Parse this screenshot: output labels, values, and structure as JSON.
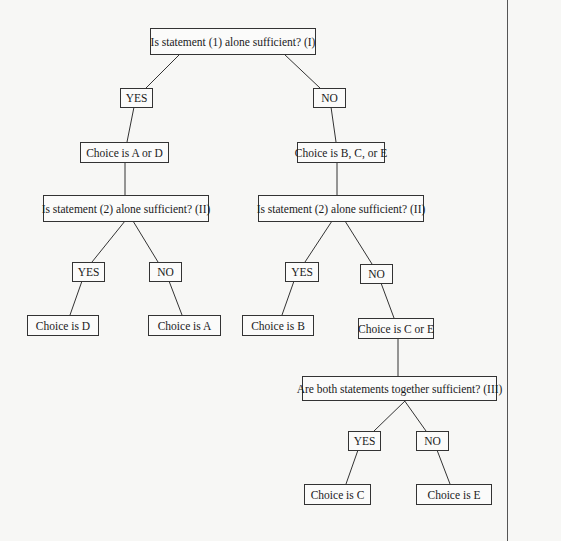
{
  "diagram": {
    "type": "decision-tree",
    "nodes": {
      "q1": "Is statement (1) alone sufficient? (I)",
      "q1_yes": "YES",
      "q1_no": "NO",
      "choice_ad": "Choice is A or D",
      "choice_bce": "Choice is B, C, or E",
      "q2_left": "Is statement (2) alone sufficient? (II)",
      "q2_right": "Is statement (2) alone sufficient? (II)",
      "q2l_yes": "YES",
      "q2l_no": "NO",
      "q2r_yes": "YES",
      "q2r_no": "NO",
      "choice_d": "Choice is D",
      "choice_a": "Choice is A",
      "choice_b": "Choice is B",
      "choice_ce": "Choice is C or E",
      "q3": "Are both statements together sufficient? (III)",
      "q3_yes": "YES",
      "q3_no": "NO",
      "choice_c": "Choice is C",
      "choice_e": "Choice is E"
    },
    "edges": [
      [
        "q1",
        "q1_yes"
      ],
      [
        "q1",
        "q1_no"
      ],
      [
        "q1_yes",
        "choice_ad"
      ],
      [
        "q1_no",
        "choice_bce"
      ],
      [
        "choice_ad",
        "q2_left"
      ],
      [
        "choice_bce",
        "q2_right"
      ],
      [
        "q2_left",
        "q2l_yes"
      ],
      [
        "q2_left",
        "q2l_no"
      ],
      [
        "q2l_yes",
        "choice_d"
      ],
      [
        "q2l_no",
        "choice_a"
      ],
      [
        "q2_right",
        "q2r_yes"
      ],
      [
        "q2_right",
        "q2r_no"
      ],
      [
        "q2r_yes",
        "choice_b"
      ],
      [
        "q2r_no",
        "choice_ce"
      ],
      [
        "choice_ce",
        "q3"
      ],
      [
        "q3",
        "q3_yes"
      ],
      [
        "q3",
        "q3_no"
      ],
      [
        "q3_yes",
        "choice_c"
      ],
      [
        "q3_no",
        "choice_e"
      ]
    ]
  }
}
